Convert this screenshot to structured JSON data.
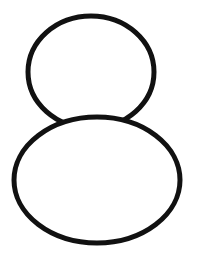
{
  "canvas": {
    "width": 199,
    "height": 262,
    "background": "#ffffff"
  },
  "stroke": {
    "color": "#111111",
    "width": 5
  },
  "shapes": {
    "upper_circle": {
      "cx": 91,
      "cy": 72,
      "rx": 63,
      "ry": 56
    },
    "lower_ellipse": {
      "cx": 97,
      "cy": 180,
      "rx": 83,
      "ry": 63
    }
  }
}
